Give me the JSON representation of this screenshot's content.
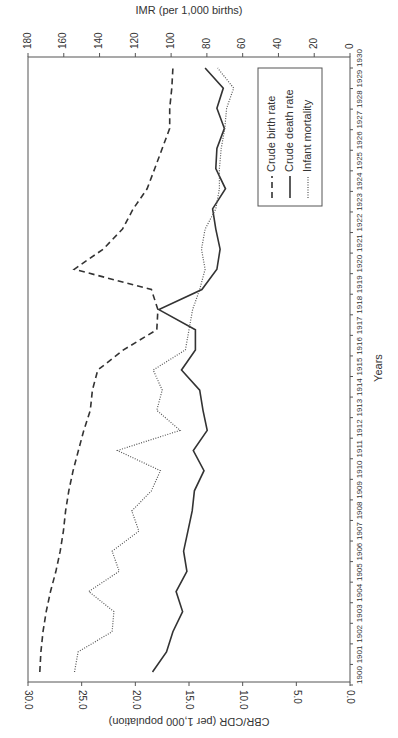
{
  "chart_data": {
    "type": "line",
    "orientation": "rotated-90-clockwise",
    "title": "",
    "xlabel": "Years",
    "ylabel": "CBR/CDR (per 1,000 population)",
    "y2label": "IMR (per 1,000 births)",
    "ylim": [
      0,
      30
    ],
    "y2lim": [
      0,
      180
    ],
    "yticks": [
      "0.0",
      "5.0",
      "10.0",
      "15.0",
      "20.0",
      "25.0",
      "30.0"
    ],
    "y2ticks": [
      "0",
      "20",
      "40",
      "60",
      "80",
      "100",
      "120",
      "140",
      "160",
      "180"
    ],
    "x": [
      1900,
      1901,
      1902,
      1903,
      1904,
      1905,
      1906,
      1907,
      1908,
      1909,
      1910,
      1911,
      1912,
      1913,
      1914,
      1915,
      1916,
      1917,
      1918,
      1919,
      1920,
      1921,
      1922,
      1923,
      1924,
      1925,
      1926,
      1927,
      1928,
      1929,
      1930
    ],
    "series": [
      {
        "name": "Crude birth rate",
        "axis": "left",
        "style": "dashed",
        "values": [
          28.9,
          28.8,
          28.6,
          28.3,
          27.9,
          27.4,
          27.0,
          26.7,
          26.5,
          26.2,
          25.8,
          25.3,
          24.8,
          24.2,
          24.0,
          23.5,
          21.1,
          18.0,
          17.9,
          18.5,
          25.7,
          23.0,
          21.2,
          20.2,
          18.9,
          18.2,
          17.5,
          16.8,
          16.8,
          16.6,
          16.5
        ]
      },
      {
        "name": "Crude death rate",
        "axis": "left",
        "style": "solid",
        "values": [
          18.4,
          17.1,
          16.5,
          15.6,
          16.2,
          15.2,
          15.5,
          15.1,
          14.7,
          14.5,
          13.6,
          14.6,
          13.3,
          13.7,
          14.0,
          15.7,
          14.4,
          14.4,
          17.8,
          13.8,
          12.4,
          12.1,
          12.5,
          12.8,
          11.6,
          12.5,
          12.4,
          11.7,
          12.4,
          11.8,
          13.5
        ]
      },
      {
        "name": "Infant mortality",
        "axis": "right",
        "style": "dotted",
        "values": [
          154,
          152,
          133,
          132,
          146,
          129,
          133,
          118,
          122,
          111,
          106,
          130,
          95,
          108,
          105,
          110,
          92,
          90,
          88,
          84,
          81,
          83,
          81,
          75,
          73,
          73,
          72,
          70,
          69,
          65,
          74
        ]
      }
    ],
    "legend": {
      "position": "upper-right (rotated)",
      "entries": [
        "Crude birth rate",
        "Crude death rate",
        "Infant mortality"
      ]
    },
    "grid": false
  }
}
